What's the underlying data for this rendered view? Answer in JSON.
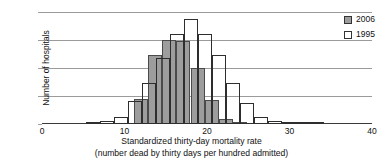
{
  "chart_data": {
    "type": "bar",
    "title": "",
    "xlabel": "Standardized thirty-day mortality rate",
    "xlabel_line2": "(number dead by thirty days per hundred admitted)",
    "ylabel": "Number of hospitals",
    "xlim": [
      0,
      40
    ],
    "ylim": [
      0,
      800
    ],
    "xticks": [
      0,
      10,
      20,
      30,
      40
    ],
    "yticks": [
      0,
      200,
      400,
      600,
      800
    ],
    "grid": "horizontal",
    "legend_position": "top-right",
    "bin_width": 1.7,
    "series": [
      {
        "name": "2006",
        "color": "#9d9d9d",
        "bins": [
          {
            "x": 11.2,
            "value": 180
          },
          {
            "x": 12.9,
            "value": 490
          },
          {
            "x": 14.6,
            "value": 600
          },
          {
            "x": 16.3,
            "value": 590
          },
          {
            "x": 18.0,
            "value": 400
          },
          {
            "x": 19.7,
            "value": 170
          },
          {
            "x": 21.4,
            "value": 35
          },
          {
            "x": 23.1,
            "value": 8
          }
        ]
      },
      {
        "name": "1995",
        "color": "#ffffff",
        "bins": [
          {
            "x": 5.3,
            "value": 15
          },
          {
            "x": 7.0,
            "value": 20
          },
          {
            "x": 8.7,
            "value": 52
          },
          {
            "x": 10.4,
            "value": 165
          },
          {
            "x": 12.1,
            "value": 290
          },
          {
            "x": 13.8,
            "value": 470
          },
          {
            "x": 15.5,
            "value": 640
          },
          {
            "x": 17.2,
            "value": 750
          },
          {
            "x": 18.9,
            "value": 645
          },
          {
            "x": 20.6,
            "value": 495
          },
          {
            "x": 22.3,
            "value": 290
          },
          {
            "x": 24.0,
            "value": 150
          },
          {
            "x": 25.7,
            "value": 52
          },
          {
            "x": 27.4,
            "value": 18
          },
          {
            "x": 29.1,
            "value": 8
          },
          {
            "x": 30.8,
            "value": 6
          },
          {
            "x": 32.5,
            "value": 4
          }
        ]
      }
    ]
  },
  "axes": {
    "ylabel": "Number of hospitals",
    "xlabel_line1": "Standardized thirty-day mortality rate",
    "xlabel_line2": "(number dead by thirty days per hundred admitted)",
    "ytick_labels": [
      "0",
      "200",
      "400",
      "600",
      "800"
    ],
    "xtick_labels": [
      "0",
      "10",
      "20",
      "30",
      "40"
    ]
  },
  "legend": {
    "items": [
      {
        "label": "2006",
        "swatch": "gray-filled-square"
      },
      {
        "label": "1995",
        "swatch": "white-open-square"
      }
    ]
  }
}
